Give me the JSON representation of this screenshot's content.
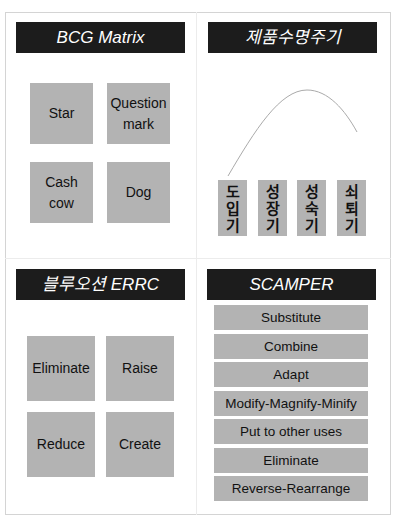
{
  "panels": {
    "bcg": {
      "title": "BCG Matrix",
      "cells": [
        {
          "label": "Star"
        },
        {
          "label": "Question\nmark"
        },
        {
          "label": "Cash\ncow"
        },
        {
          "label": "Dog"
        }
      ]
    },
    "plc": {
      "title": "제품수명주기",
      "stages": [
        {
          "label": "도입기",
          "chars": [
            "도",
            "입",
            "기"
          ]
        },
        {
          "label": "성장기",
          "chars": [
            "성",
            "장",
            "기"
          ]
        },
        {
          "label": "성숙기",
          "chars": [
            "성",
            "숙",
            "기"
          ]
        },
        {
          "label": "쇠퇴기",
          "chars": [
            "쇠",
            "퇴",
            "기"
          ]
        }
      ],
      "curve_icon": "bell-curve"
    },
    "errc": {
      "title": "블루오션 ERRC",
      "cells": [
        {
          "label": "Eliminate"
        },
        {
          "label": "Raise"
        },
        {
          "label": "Reduce"
        },
        {
          "label": "Create"
        }
      ]
    },
    "scamper": {
      "title": "SCAMPER",
      "items": [
        {
          "label": "Substitute"
        },
        {
          "label": "Combine"
        },
        {
          "label": "Adapt"
        },
        {
          "label": "Modify-Magnify-Minify"
        },
        {
          "label": "Put to other uses"
        },
        {
          "label": "Eliminate"
        },
        {
          "label": "Reverse-Rearrange"
        }
      ]
    }
  },
  "colors": {
    "title_bg": "#1c1c1c",
    "box_bg": "#b3b3b3",
    "border": "#d4d4d4"
  }
}
